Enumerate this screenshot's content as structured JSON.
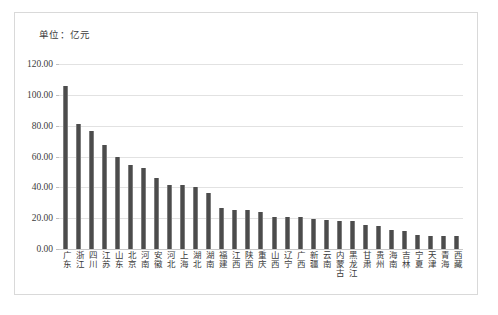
{
  "unit_note": "单位：亿元",
  "chart_data": {
    "type": "bar",
    "title": "",
    "subtitle": "",
    "xlabel": "",
    "ylabel": "",
    "unit": "亿元",
    "ylim": [
      0,
      120
    ],
    "ytick_labels": [
      "120.00",
      "100.00",
      "80.00",
      "60.00",
      "40.00",
      "20.00",
      "0.00"
    ],
    "ytick_values": [
      120,
      100,
      80,
      60,
      40,
      20,
      0
    ],
    "grid": true,
    "legend": "none",
    "bar_color": "#4c4c4c",
    "categories": [
      "广东",
      "浙江",
      "四川",
      "江苏",
      "山东",
      "北京",
      "河南",
      "安徽",
      "河北",
      "上海",
      "湖北",
      "湖南",
      "福建",
      "江西",
      "陕西",
      "重庆",
      "山西",
      "辽宁",
      "广西",
      "新疆",
      "云南",
      "内蒙古",
      "黑龙江",
      "甘肃",
      "贵州",
      "海南",
      "吉林",
      "宁夏",
      "天津",
      "青海",
      "西藏"
    ],
    "values": [
      106.0,
      81.0,
      76.5,
      67.5,
      59.5,
      54.5,
      52.5,
      46.0,
      41.5,
      41.5,
      40.0,
      36.5,
      26.5,
      25.5,
      25.0,
      24.0,
      21.0,
      20.5,
      20.5,
      19.5,
      18.5,
      18.0,
      18.0,
      15.5,
      15.0,
      12.5,
      11.5,
      9.0,
      8.5,
      8.5,
      8.5
    ]
  }
}
